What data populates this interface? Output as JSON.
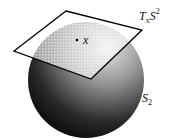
{
  "diagram": {
    "sphere_label": "S",
    "sphere_subscript": "2",
    "plane_label_T": "T",
    "plane_label_sub": "x",
    "plane_label_S": "S",
    "plane_label_sup": "2",
    "point_label": "x",
    "colors": {
      "sphere_dark": "#111111",
      "sphere_light": "#d8d8d8",
      "plane_border": "#000000",
      "plane_fill": "#ffffff"
    }
  }
}
